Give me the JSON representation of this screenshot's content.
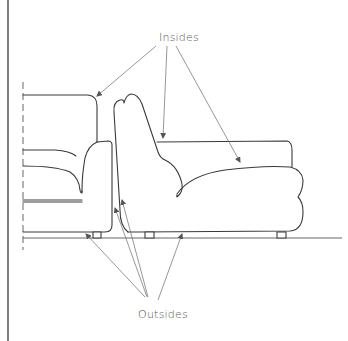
{
  "figure": {
    "labels": {
      "insides": "Insides",
      "outsides": "Outsides"
    },
    "colors": {
      "line": "#3a3a3a",
      "leader": "#6a6a6a",
      "text": "#555555",
      "background": "#ffffff"
    }
  }
}
